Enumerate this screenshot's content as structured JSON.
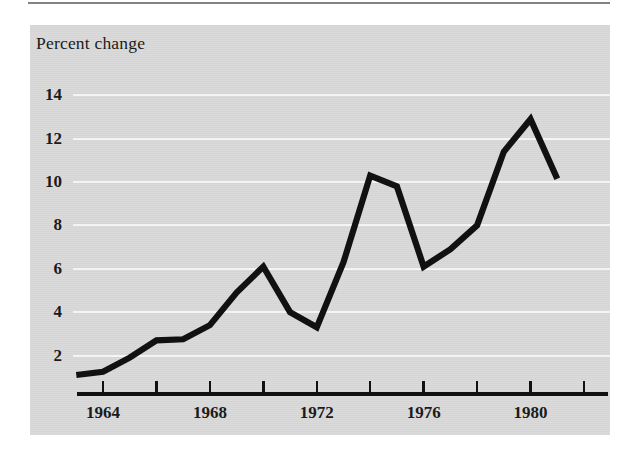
{
  "chart_data": {
    "type": "line",
    "title": "Percent change",
    "xlabel": "",
    "ylabel": "Percent change",
    "ylim": [
      0,
      15
    ],
    "xlim": [
      1963,
      1982
    ],
    "grid": true,
    "legend_position": "none",
    "y_ticks": [
      2,
      4,
      6,
      8,
      10,
      12,
      14
    ],
    "y_tick_labels": [
      "2",
      "4",
      "6",
      "8",
      "10",
      "12",
      "14"
    ],
    "x_ticks": [
      1964,
      1966,
      1968,
      1970,
      1972,
      1974,
      1976,
      1978,
      1980,
      1982
    ],
    "x_tick_labels": [
      "1964",
      "",
      "1968",
      "",
      "1972",
      "",
      "1976",
      "",
      "1980",
      ""
    ],
    "x_labeled_ticks": [
      "1964",
      "1968",
      "1972",
      "1976",
      "1980"
    ],
    "series": [
      {
        "name": "Percent change",
        "color": "#111111",
        "x": [
          1963,
          1964,
          1965,
          1966,
          1967,
          1968,
          1969,
          1970,
          1971,
          1972,
          1973,
          1974,
          1975,
          1976,
          1977,
          1978,
          1979,
          1980,
          1981
        ],
        "values": [
          1.1,
          1.25,
          1.9,
          2.7,
          2.75,
          3.4,
          4.9,
          6.1,
          4.0,
          3.3,
          6.3,
          10.3,
          9.8,
          6.1,
          6.9,
          8.0,
          11.4,
          12.9,
          10.15
        ]
      }
    ],
    "annotations": []
  },
  "axes": {
    "y_label_rows": [
      {
        "label": "14",
        "value": 14
      },
      {
        "label": "12",
        "value": 12
      },
      {
        "label": "10",
        "value": 10
      },
      {
        "label": "8",
        "value": 8
      },
      {
        "label": "6",
        "value": 6
      },
      {
        "label": "4",
        "value": 4
      },
      {
        "label": "2",
        "value": 2
      }
    ],
    "x_label_cols": [
      {
        "label": "1964",
        "value": 1964
      },
      {
        "label": "1968",
        "value": 1968
      },
      {
        "label": "1972",
        "value": 1972
      },
      {
        "label": "1976",
        "value": 1976
      },
      {
        "label": "1980",
        "value": 1980
      }
    ]
  },
  "style": {
    "panel_color": "#d9d9d9",
    "grid_color": "#f4f4f4",
    "line_color": "#111111",
    "text_color": "#1b1b1b",
    "page_color": "#ffffff"
  }
}
